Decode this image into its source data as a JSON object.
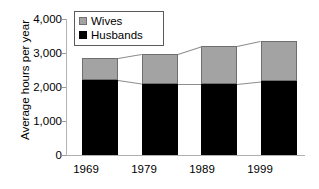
{
  "chart_data": {
    "type": "bar",
    "subtype": "stacked-bar-with-connectors",
    "title": "",
    "xlabel": "",
    "ylabel": "Average hours per year",
    "categories": [
      "1969",
      "1979",
      "1989",
      "1999"
    ],
    "series": [
      {
        "name": "Husbands",
        "color": "#000000",
        "values": [
          2200,
          2100,
          2100,
          2170
        ]
      },
      {
        "name": "Wives",
        "color": "#a3a3a3",
        "values": [
          650,
          870,
          1100,
          1180
        ]
      }
    ],
    "totals": [
      2850,
      2970,
      3200,
      3350
    ],
    "ylim": [
      0,
      4000
    ],
    "yticks": [
      0,
      1000,
      2000,
      3000,
      4000
    ],
    "ytick_labels": [
      "0",
      "1,000",
      "2,000",
      "3,000",
      "4,000"
    ],
    "grid": false,
    "legend_position": "top-left",
    "legend_entries": [
      "Wives",
      "Husbands"
    ],
    "connectors": true
  },
  "legend": {
    "wives_label": "Wives",
    "husbands_label": "Husbands"
  },
  "axes": {
    "y_title": "Average hours per year"
  }
}
